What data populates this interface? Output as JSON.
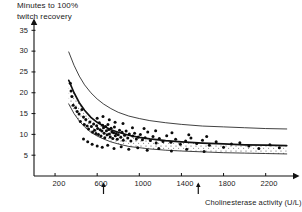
{
  "chart_data": {
    "type": "scatter",
    "title": "",
    "ylabel": "Minutes to 100%\ntwitch recovery",
    "ylabel_line1": "Minutes to 100%",
    "ylabel_line2": "twitch recovery",
    "xlabel": "Cholinesterase activity (U/L)",
    "xlim": [
      0,
      2450
    ],
    "ylim": [
      0,
      37
    ],
    "grid": false,
    "legend": null,
    "xticks": [
      200,
      600,
      1000,
      1400,
      1800,
      2200
    ],
    "yticks": [
      5,
      10,
      15,
      20,
      25,
      30,
      35
    ],
    "annotations": [
      {
        "name": "arrow-marker-low",
        "x": 660,
        "label": "",
        "axis": "x"
      },
      {
        "name": "arrow-marker-high",
        "x": 1560,
        "label": "",
        "axis": "x"
      }
    ],
    "series": [
      {
        "name": "regression-curve",
        "type": "line",
        "style": "solid-thick",
        "x": [
          330,
          380,
          430,
          480,
          540,
          600,
          660,
          730,
          800,
          900,
          1000,
          1100,
          1250,
          1400,
          1600,
          1800,
          2000,
          2200,
          2400
        ],
        "y": [
          23.0,
          20.0,
          17.6,
          15.8,
          14.1,
          12.9,
          12.0,
          11.1,
          10.5,
          9.8,
          9.3,
          8.9,
          8.5,
          8.2,
          7.9,
          7.7,
          7.5,
          7.4,
          7.3
        ]
      },
      {
        "name": "upper-confidence-limit",
        "type": "line",
        "style": "solid-thin",
        "x": [
          330,
          380,
          430,
          480,
          540,
          600,
          660,
          730,
          800,
          900,
          1000,
          1100,
          1250,
          1400,
          1600,
          1800,
          2000,
          2200,
          2400
        ],
        "y": [
          29.8,
          26.6,
          24.0,
          21.9,
          20.0,
          18.5,
          17.3,
          16.2,
          15.3,
          14.4,
          13.8,
          13.3,
          12.8,
          12.4,
          12.0,
          11.8,
          11.6,
          11.4,
          11.3
        ]
      },
      {
        "name": "lower-confidence-limit",
        "type": "line",
        "style": "solid-thin",
        "x": [
          330,
          380,
          430,
          480,
          540,
          600,
          660,
          730,
          800,
          900,
          1000,
          1100,
          1250,
          1400,
          1600,
          1800,
          2000,
          2200,
          2400
        ],
        "y": [
          17.3,
          15.0,
          13.2,
          11.8,
          10.5,
          9.6,
          8.9,
          8.2,
          7.7,
          7.1,
          6.8,
          6.5,
          6.2,
          6.0,
          5.8,
          5.6,
          5.5,
          5.4,
          5.3
        ]
      },
      {
        "name": "observations",
        "type": "scatter",
        "marker": "filled-circle",
        "points": [
          [
            345,
            22.3
          ],
          [
            352,
            20.4
          ],
          [
            360,
            19.1
          ],
          [
            372,
            17.0
          ],
          [
            395,
            16.4
          ],
          [
            410,
            15.5
          ],
          [
            428,
            14.9
          ],
          [
            440,
            13.1
          ],
          [
            455,
            16.0
          ],
          [
            470,
            14.2
          ],
          [
            478,
            12.4
          ],
          [
            492,
            13.6
          ],
          [
            505,
            12.0
          ],
          [
            518,
            11.3
          ],
          [
            530,
            13.0
          ],
          [
            545,
            11.9
          ],
          [
            556,
            10.6
          ],
          [
            566,
            12.5
          ],
          [
            575,
            11.0
          ],
          [
            588,
            10.2
          ],
          [
            595,
            12.1
          ],
          [
            604,
            11.4
          ],
          [
            612,
            10.0
          ],
          [
            620,
            12.8
          ],
          [
            628,
            11.1
          ],
          [
            636,
            9.6
          ],
          [
            645,
            10.8
          ],
          [
            652,
            12.2
          ],
          [
            660,
            11.6
          ],
          [
            666,
            10.3
          ],
          [
            672,
            9.2
          ],
          [
            680,
            11.9
          ],
          [
            688,
            10.9
          ],
          [
            695,
            9.9
          ],
          [
            702,
            12.4
          ],
          [
            710,
            11.2
          ],
          [
            716,
            10.1
          ],
          [
            724,
            9.4
          ],
          [
            732,
            11.5
          ],
          [
            740,
            10.6
          ],
          [
            748,
            9.0
          ],
          [
            756,
            10.4
          ],
          [
            764,
            11.8
          ],
          [
            772,
            9.7
          ],
          [
            780,
            10.2
          ],
          [
            790,
            8.8
          ],
          [
            800,
            9.9
          ],
          [
            812,
            11.0
          ],
          [
            824,
            9.3
          ],
          [
            836,
            10.5
          ],
          [
            848,
            8.6
          ],
          [
            860,
            9.8
          ],
          [
            875,
            10.8
          ],
          [
            890,
            9.1
          ],
          [
            905,
            10.1
          ],
          [
            920,
            8.4
          ],
          [
            938,
            9.6
          ],
          [
            955,
            10.3
          ],
          [
            972,
            8.9
          ],
          [
            990,
            9.4
          ],
          [
            1010,
            10.0
          ],
          [
            1030,
            8.7
          ],
          [
            1055,
            9.2
          ],
          [
            1080,
            10.6
          ],
          [
            1105,
            8.5
          ],
          [
            1130,
            9.5
          ],
          [
            1160,
            7.9
          ],
          [
            1190,
            9.0
          ],
          [
            1225,
            8.3
          ],
          [
            1260,
            9.7
          ],
          [
            1300,
            8.1
          ],
          [
            1345,
            8.8
          ],
          [
            1390,
            7.6
          ],
          [
            1440,
            8.4
          ],
          [
            1490,
            9.1
          ],
          [
            1545,
            7.8
          ],
          [
            1600,
            8.6
          ],
          [
            1665,
            7.4
          ],
          [
            1730,
            8.2
          ],
          [
            1800,
            6.9
          ],
          [
            1875,
            7.7
          ],
          [
            1955,
            8.0
          ],
          [
            2040,
            7.2
          ],
          [
            2135,
            6.6
          ],
          [
            2240,
            7.5
          ],
          [
            2330,
            6.8
          ],
          [
            600,
            13.9
          ],
          [
            655,
            14.3
          ],
          [
            715,
            13.5
          ],
          [
            770,
            12.9
          ],
          [
            845,
            12.6
          ],
          [
            935,
            11.6
          ],
          [
            1045,
            11.4
          ],
          [
            1155,
            10.9
          ],
          [
            1310,
            10.4
          ],
          [
            1470,
            9.9
          ],
          [
            1640,
            9.5
          ],
          [
            470,
            8.9
          ],
          [
            510,
            8.2
          ],
          [
            552,
            7.6
          ],
          [
            600,
            7.2
          ],
          [
            648,
            6.9
          ],
          [
            700,
            7.4
          ],
          [
            760,
            6.6
          ],
          [
            828,
            7.0
          ],
          [
            900,
            6.4
          ],
          [
            985,
            6.8
          ],
          [
            1075,
            6.2
          ],
          [
            1185,
            6.6
          ],
          [
            1305,
            6.0
          ],
          [
            1450,
            6.4
          ],
          [
            1615,
            5.9
          ]
        ]
      }
    ]
  },
  "axes": {
    "y_tick_labels": [
      "35",
      "30",
      "25",
      "20",
      "15",
      "10",
      "5"
    ],
    "x_tick_labels": [
      "200",
      "600",
      "1000",
      "1400",
      "1800",
      "2200"
    ]
  }
}
